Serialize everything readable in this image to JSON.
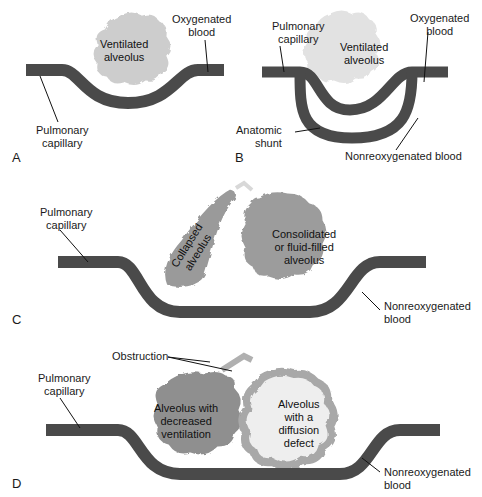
{
  "colors": {
    "vessel": "#4a4a4a",
    "ventilated_alveolus": "#cfcfcf",
    "consolidated_alveolus": "#9a9a9a",
    "decreased_ventilation_alveolus": "#8f8f8f",
    "diffusion_defect_wall": "#a8a8a8",
    "diffusion_defect_inner": "#efefef",
    "leader_line": "#111111"
  },
  "panels": [
    {
      "letter": "A",
      "labels": {
        "alveolus": [
          "Ventilated",
          "alveolus"
        ],
        "capillary": [
          "Pulmonary",
          "capillary"
        ],
        "oxygenated": [
          "Oxygenated",
          "blood"
        ]
      }
    },
    {
      "letter": "B",
      "labels": {
        "capillary": [
          "Pulmonary",
          "capillary"
        ],
        "alveolus": [
          "Ventilated",
          "alveolus"
        ],
        "oxygenated": [
          "Oxygenated",
          "blood"
        ],
        "shunt": [
          "Anatomic",
          "shunt"
        ],
        "nonreoxygenated": "Nonreoxygenated blood"
      }
    },
    {
      "letter": "C",
      "labels": {
        "capillary": [
          "Pulmonary",
          "capillary"
        ],
        "collapsed": [
          "Collapsed",
          "alveolus"
        ],
        "consolidated": [
          "Consolidated",
          "or fluid-filled",
          "alveolus"
        ],
        "nonreoxygenated": [
          "Nonreoxygenated",
          "blood"
        ]
      }
    },
    {
      "letter": "D",
      "labels": {
        "obstruction": "Obstruction",
        "capillary": [
          "Pulmonary",
          "capillary"
        ],
        "decreased": [
          "Alveolus with",
          "decreased",
          "ventilation"
        ],
        "diffusion": [
          "Alveolus",
          "with a",
          "diffusion",
          "defect"
        ],
        "nonreoxygenated": [
          "Nonreoxygenated",
          "blood"
        ]
      }
    }
  ]
}
